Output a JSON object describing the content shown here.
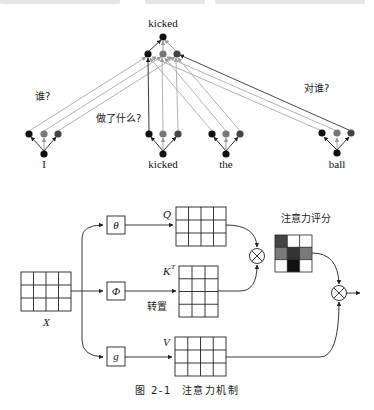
{
  "top_section": {
    "root_word": "kicked",
    "words": [
      "I",
      "kicked",
      "the",
      "ball"
    ],
    "questions": {
      "who": "谁?",
      "did_what": "做了什么?",
      "to_whom": "对谁?"
    },
    "node_colors": {
      "black": "#111111",
      "dark_gray": "#444444",
      "mid_gray": "#777777",
      "edge_light": "#aaaaaa",
      "edge_dark": "#333333"
    }
  },
  "bottom_section": {
    "input_label": "X",
    "branches": [
      {
        "op": "θ",
        "output": "Q"
      },
      {
        "op": "Φ",
        "output": "K",
        "output_sup": "T",
        "note": "转置"
      },
      {
        "op": "g",
        "output": "V"
      }
    ],
    "score_label": "注意力评分",
    "multiply_symbol": "⊗",
    "score_matrix": [
      [
        "#444444",
        "#ffffff",
        "#ffffff"
      ],
      [
        "#7a7a7a",
        "#333333",
        "#7a7a7a"
      ],
      [
        "#ffffff",
        "#111111",
        "#ffffff"
      ]
    ]
  },
  "caption": {
    "figure_number": "图 2-1",
    "title": "注意力机制"
  }
}
